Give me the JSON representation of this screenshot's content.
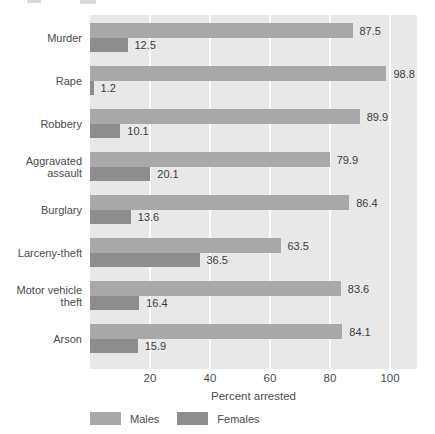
{
  "chart_data": {
    "type": "bar",
    "orientation": "horizontal",
    "title": "",
    "xlabel": "Percent arrested",
    "ylabel": "",
    "categories": [
      "Murder",
      "Rape",
      "Robbery",
      "Aggravated assault",
      "Burglary",
      "Larceny-theft",
      "Motor vehicle theft",
      "Arson"
    ],
    "series": [
      {
        "name": "Males",
        "values": [
          87.5,
          98.8,
          89.9,
          79.9,
          86.4,
          63.5,
          83.6,
          84.1
        ]
      },
      {
        "name": "Females",
        "values": [
          12.5,
          1.2,
          10.1,
          20.1,
          13.6,
          36.5,
          16.4,
          15.9
        ]
      }
    ],
    "value_labels_shown": true,
    "xticks": [
      20,
      40,
      60,
      80,
      100
    ],
    "xlim": [
      0,
      109
    ],
    "grid": "vertical-white-lines",
    "legend_position": "bottom",
    "colors": {
      "males_bar": "#a8a8a8",
      "females_bar": "#8d8d8d",
      "plot_background": "#e8e8e8",
      "gridline": "#fcfcfc",
      "text": "#4a4a4a"
    }
  },
  "legend": {
    "males_label": "Males",
    "females_label": "Females"
  }
}
